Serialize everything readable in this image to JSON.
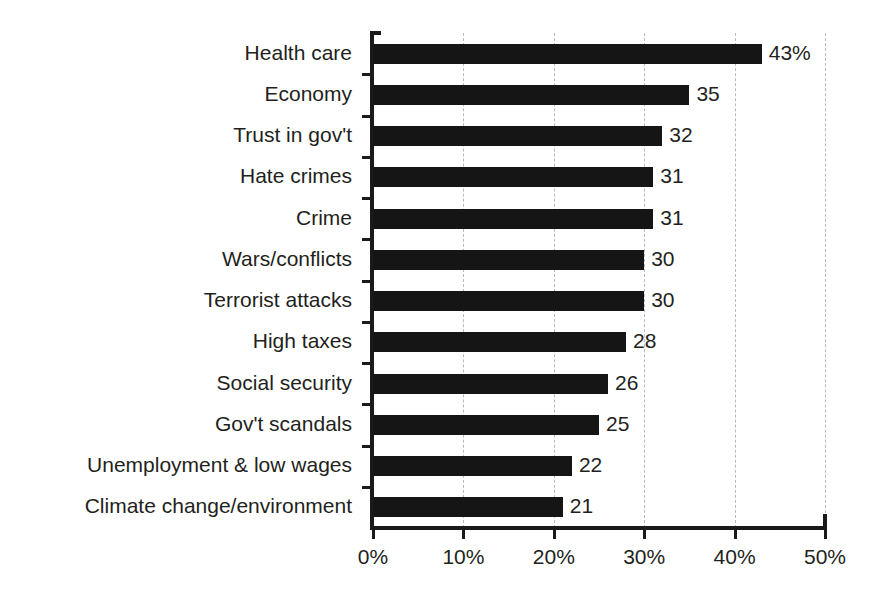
{
  "chart_data": {
    "type": "bar",
    "orientation": "horizontal",
    "title": "",
    "subtitle": "",
    "xlabel": "",
    "ylabel": "",
    "xlim": [
      0,
      50
    ],
    "grid": "vertical-dashed",
    "legend": "none",
    "bar_color": "#151515",
    "gridline_color": "#b9b9b9",
    "axis_color": "#1a1a1a",
    "text_color": "#231f20",
    "categories": [
      "Health care",
      "Economy",
      "Trust in gov't",
      "Hate crimes",
      "Crime",
      "Wars/conflicts",
      "Terrorist attacks",
      "High taxes",
      "Social security",
      "Gov't scandals",
      "Unemployment & low wages",
      "Climate change/environment"
    ],
    "values": [
      43,
      35,
      32,
      31,
      31,
      30,
      30,
      28,
      26,
      25,
      22,
      21
    ],
    "value_labels": [
      "43%",
      "35",
      "32",
      "31",
      "31",
      "30",
      "30",
      "28",
      "26",
      "25",
      "22",
      "21"
    ],
    "xticks": [
      0,
      10,
      20,
      30,
      40,
      50
    ],
    "xtick_labels": [
      "0%",
      "10%",
      "20%",
      "30%",
      "40%",
      "50%"
    ]
  }
}
